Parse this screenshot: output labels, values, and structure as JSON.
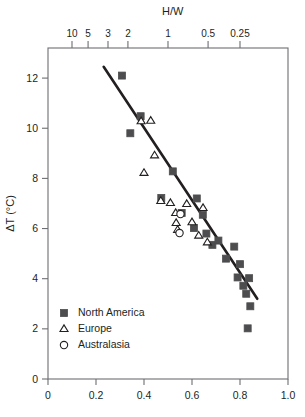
{
  "chart_data": {
    "type": "scatter",
    "title": "",
    "xlabel": "",
    "ylabel": "ΔT (°C)",
    "top_axis_label": "H/W",
    "xlim": [
      0,
      1.0
    ],
    "ylim": [
      0,
      13.2
    ],
    "grid": false,
    "legend_position": "bottom-left",
    "x_ticks": [
      {
        "value": 0,
        "label": "0"
      },
      {
        "value": 0.2,
        "label": "0.2"
      },
      {
        "value": 0.4,
        "label": "0.4"
      },
      {
        "value": 0.6,
        "label": "0.6"
      },
      {
        "value": 0.8,
        "label": "0.8"
      },
      {
        "value": 1.0,
        "label": "1.0"
      }
    ],
    "y_ticks": [
      {
        "value": 0,
        "label": "0"
      },
      {
        "value": 2,
        "label": "2"
      },
      {
        "value": 4,
        "label": "4"
      },
      {
        "value": 6,
        "label": "6"
      },
      {
        "value": 8,
        "label": "8"
      },
      {
        "value": 10,
        "label": "10"
      },
      {
        "value": 12,
        "label": "12"
      }
    ],
    "top_ticks": [
      {
        "x": 0.1,
        "label": "10"
      },
      {
        "x": 0.167,
        "label": "5"
      },
      {
        "x": 0.25,
        "label": "3"
      },
      {
        "x": 0.333,
        "label": "2"
      },
      {
        "x": 0.5,
        "label": "1"
      },
      {
        "x": 0.667,
        "label": "0.5"
      },
      {
        "x": 0.8,
        "label": "0.25"
      }
    ],
    "trend_line": {
      "x0": 0.232,
      "y0": 12.45,
      "x1": 0.872,
      "y1": 3.2,
      "color": "#231f20",
      "width": 2.6
    },
    "series": [
      {
        "name": "North America",
        "marker": "filled-square",
        "color": "#4d4d4f",
        "points": [
          [
            0.308,
            12.1
          ],
          [
            0.386,
            10.48
          ],
          [
            0.343,
            9.8
          ],
          [
            0.472,
            7.22
          ],
          [
            0.52,
            8.28
          ],
          [
            0.557,
            6.62
          ],
          [
            0.62,
            7.2
          ],
          [
            0.645,
            6.55
          ],
          [
            0.608,
            6.02
          ],
          [
            0.66,
            5.8
          ],
          [
            0.685,
            5.35
          ],
          [
            0.71,
            5.52
          ],
          [
            0.742,
            4.8
          ],
          [
            0.776,
            5.28
          ],
          [
            0.8,
            4.58
          ],
          [
            0.79,
            4.05
          ],
          [
            0.814,
            3.72
          ],
          [
            0.826,
            3.4
          ],
          [
            0.838,
            4.02
          ],
          [
            0.843,
            2.9
          ],
          [
            0.832,
            2.02
          ]
        ]
      },
      {
        "name": "Europe",
        "marker": "open-triangle",
        "color": "#231f20",
        "points": [
          [
            0.388,
            10.28
          ],
          [
            0.428,
            10.3
          ],
          [
            0.444,
            8.92
          ],
          [
            0.4,
            8.22
          ],
          [
            0.47,
            7.1
          ],
          [
            0.51,
            7.02
          ],
          [
            0.532,
            6.62
          ],
          [
            0.534,
            6.22
          ],
          [
            0.54,
            5.95
          ],
          [
            0.578,
            6.98
          ],
          [
            0.6,
            6.25
          ],
          [
            0.628,
            5.72
          ],
          [
            0.646,
            6.82
          ],
          [
            0.664,
            5.45
          ]
        ]
      },
      {
        "name": "Australasia",
        "marker": "open-circle",
        "color": "#231f20",
        "points": [
          [
            0.552,
            6.58
          ],
          [
            0.548,
            5.82
          ]
        ]
      }
    ]
  },
  "legend": {
    "items": [
      {
        "label": "North America",
        "marker": "filled-square"
      },
      {
        "label": "Europe",
        "marker": "open-triangle"
      },
      {
        "label": "Australasia",
        "marker": "open-circle"
      }
    ]
  }
}
